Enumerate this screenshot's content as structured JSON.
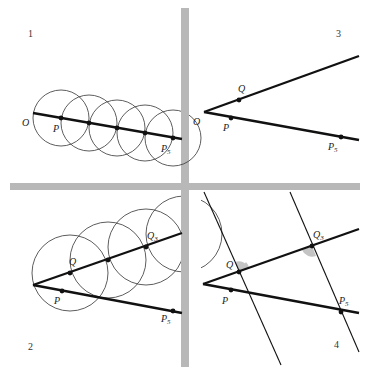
{
  "figure": {
    "colors": {
      "background": "#ffffff",
      "ink": "#111111",
      "divider": "#b8b8b8",
      "angle_shade": "#bdbdbd"
    },
    "panels": [
      {
        "number": "1",
        "labels": {
          "O": "O",
          "P": "P",
          "P5": "P5"
        },
        "description": "Five equal circles stepped along ray OP, marking P...P5"
      },
      {
        "number": "2",
        "labels": {
          "Q": "Q",
          "Q3": "Q3",
          "P": "P",
          "P5": "P5"
        },
        "description": "Second ray from O; circles mark Q...Q3"
      },
      {
        "number": "3",
        "labels": {
          "O": "O",
          "Q": "Q",
          "P": "P",
          "P5": "P5"
        },
        "description": "Two rays from O with Q, P, P5 marked"
      },
      {
        "number": "4",
        "labels": {
          "Q": "Q",
          "Q3": "Q3",
          "P": "P",
          "P5": "P5"
        },
        "description": "Parallel lines through Q3-P5 and Q with equal shaded angles"
      }
    ]
  }
}
